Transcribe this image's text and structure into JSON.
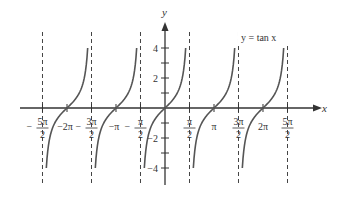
{
  "chart_data": {
    "type": "line",
    "title": "",
    "function_label": "y = tan x",
    "xlabel": "x",
    "ylabel": "y",
    "xlim": [
      -8.4,
      9.0
    ],
    "ylim": [
      -4.4,
      5.0
    ],
    "grid": false,
    "asymptotes": [
      -7.854,
      -4.712,
      -1.571,
      1.571,
      4.712,
      7.854
    ],
    "asymptote_labels": [
      "5π/2",
      "3π/2",
      "π/2",
      "π/2",
      "3π/2",
      "5π/2"
    ],
    "x_ticks": [
      {
        "value": -7.854,
        "label": "−5π/2"
      },
      {
        "value": -6.283,
        "label": "−2π"
      },
      {
        "value": -4.712,
        "label": "−3π/2"
      },
      {
        "value": -3.142,
        "label": "−π"
      },
      {
        "value": -1.571,
        "label": "−π/2"
      },
      {
        "value": 1.571,
        "label": "π/2"
      },
      {
        "value": 3.142,
        "label": "π"
      },
      {
        "value": 4.712,
        "label": "3π/2"
      },
      {
        "value": 6.283,
        "label": "2π"
      },
      {
        "value": 7.854,
        "label": "5π/2"
      }
    ],
    "y_ticks": [
      {
        "value": 4,
        "label": "4"
      },
      {
        "value": 3,
        "label": ""
      },
      {
        "value": 2,
        "label": "2"
      },
      {
        "value": 1,
        "label": ""
      },
      {
        "value": -1,
        "label": ""
      },
      {
        "value": -2,
        "label": "−2"
      },
      {
        "value": -3,
        "label": ""
      },
      {
        "value": -4,
        "label": "−4"
      }
    ],
    "series": [
      {
        "name": "tan x",
        "branches_centered_at": [
          -6.283,
          -3.142,
          0,
          3.142,
          6.283
        ],
        "y_clip": [
          -4,
          4
        ]
      }
    ]
  },
  "labels": {
    "function": "y = tan x",
    "x_axis": "x",
    "y_axis": "y"
  }
}
